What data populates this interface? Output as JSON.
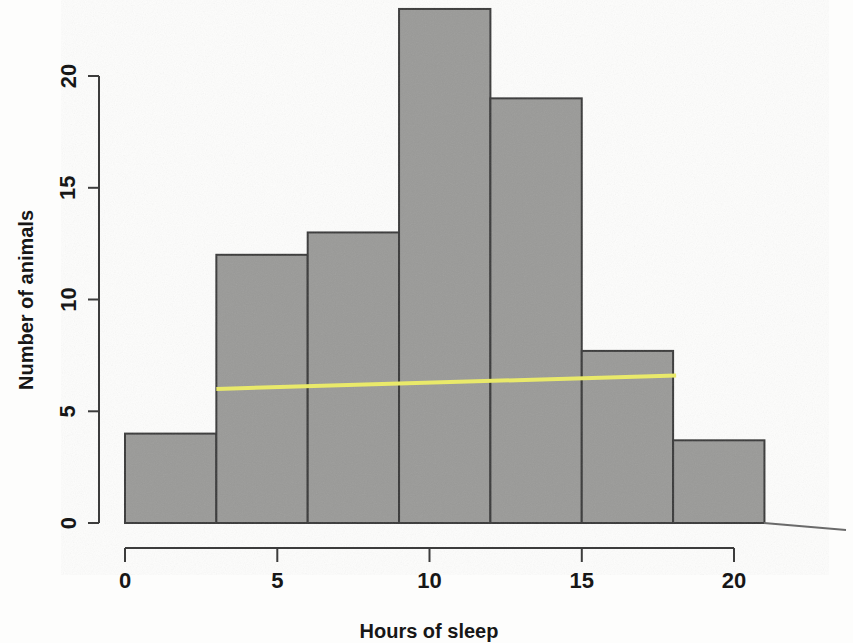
{
  "chart_data": {
    "type": "bar",
    "title": "",
    "subtitle": "",
    "xlabel": "Hours of sleep",
    "ylabel": "Number of animals",
    "xlim": [
      0,
      21
    ],
    "ylim": [
      0,
      23
    ],
    "xticks": [
      0,
      5,
      10,
      15,
      20
    ],
    "xtick_labels": [
      "0",
      "5",
      "10",
      "15",
      "20"
    ],
    "yticks": [
      0,
      5,
      10,
      15,
      20
    ],
    "ytick_labels": [
      "0",
      "5",
      "10",
      "15",
      "20"
    ],
    "grid": false,
    "legend": "none",
    "bin_width": 3,
    "bin_edges": [
      0,
      3,
      6,
      9,
      12,
      15,
      18,
      21
    ],
    "bin_ranges": [
      "0-3",
      "3-6",
      "6-9",
      "9-12",
      "12-15",
      "15-18",
      "18-21"
    ],
    "categories": [
      "0-3",
      "3-6",
      "6-9",
      "9-12",
      "12-15",
      "15-18",
      "18-21"
    ],
    "values": [
      4,
      12,
      13,
      23,
      19,
      7.7,
      3.7
    ],
    "bar_color": "#9a9a98",
    "bar_edge_color": "#3a3a3a",
    "annotations": [
      {
        "name": "trend-line",
        "type": "line",
        "color": "#e9e96a",
        "x_start": 3,
        "y_start": 6.0,
        "x_end": 18.1,
        "y_end": 6.6
      }
    ]
  },
  "axes": {
    "x_title": "Hours of sleep",
    "y_title": "Number of animals"
  }
}
